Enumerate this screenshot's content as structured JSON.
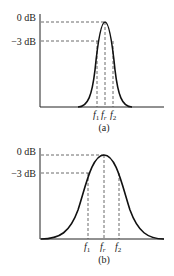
{
  "panels": [
    {
      "id": "a",
      "caption": "(a)",
      "y_labels": {
        "top": "0 dB",
        "minus3": "−3 dB"
      },
      "x_labels": {
        "f1": "f",
        "f1_sub": "1",
        "fr": "f",
        "fr_sub": "r",
        "f2": "f",
        "f2_sub": "2"
      },
      "description": "Narrow bandwidth resonance curve"
    },
    {
      "id": "b",
      "caption": "(b)",
      "y_labels": {
        "top": "0 dB",
        "minus3": "−3 dB"
      },
      "x_labels": {
        "f1": "f",
        "f1_sub": "1",
        "fr": "f",
        "fr_sub": "r",
        "f2": "f",
        "f2_sub": "2"
      },
      "description": "Wide bandwidth resonance curve"
    }
  ]
}
